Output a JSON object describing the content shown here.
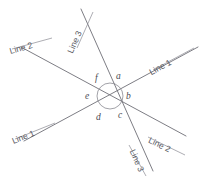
{
  "diagram": {
    "background_color": "#ffffff",
    "stroke_color": "#6e6e76",
    "text_color": "#55555d",
    "intersection": {
      "x": 110,
      "y": 96
    },
    "arc": {
      "radius": 13,
      "visible": true
    },
    "lines": [
      {
        "id": "line-1",
        "name": "Line 1",
        "x1": 24,
        "y1": 141,
        "x2": 198,
        "y2": 47
      },
      {
        "id": "line-2",
        "name": "Line 2",
        "x1": 21,
        "y1": 47,
        "x2": 186,
        "y2": 136
      },
      {
        "id": "line-3",
        "name": "Line 3",
        "x1": 81,
        "y1": 9,
        "x2": 153,
        "y2": 171
      }
    ],
    "line_labels": [
      {
        "id": "line-3-top",
        "text": "Line 3",
        "x": 74,
        "y": 46,
        "rotate": -66,
        "underline": true
      },
      {
        "id": "line-2-left",
        "text": "Line 2",
        "x": 11,
        "y": 47,
        "rotate": -16,
        "underline": true
      },
      {
        "id": "line-1-right",
        "text": "Line 1",
        "x": 152,
        "y": 68,
        "rotate": -28,
        "underline": true
      },
      {
        "id": "line-1-left",
        "text": "Line 1",
        "x": 14,
        "y": 137,
        "rotate": -22,
        "underline": true
      },
      {
        "id": "line-2-right",
        "text": "Line 2",
        "x": 147,
        "y": 135,
        "rotate": 26,
        "underline": true
      },
      {
        "id": "line-3-bottom",
        "text": "Line 3",
        "x": 128,
        "y": 143,
        "rotate": 66,
        "underline": true
      }
    ],
    "angle_labels": [
      {
        "id": "angle-a",
        "text": "a",
        "x": 116,
        "y": 72
      },
      {
        "id": "angle-b",
        "text": "b",
        "x": 126,
        "y": 92
      },
      {
        "id": "angle-c",
        "text": "c",
        "x": 118,
        "y": 111
      },
      {
        "id": "angle-d",
        "text": "d",
        "x": 96,
        "y": 113
      },
      {
        "id": "angle-e",
        "text": "e",
        "x": 85,
        "y": 92
      },
      {
        "id": "angle-f",
        "text": "f",
        "x": 95,
        "y": 74
      }
    ]
  }
}
